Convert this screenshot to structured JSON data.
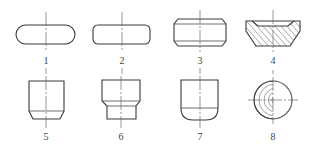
{
  "figure": {
    "labels": [
      "1",
      "2",
      "3",
      "4",
      "5",
      "6",
      "7",
      "8"
    ],
    "shapes": [
      {
        "id": "1",
        "kind": "stadium (full rounded ends)"
      },
      {
        "id": "2",
        "kind": "rounded rectangle"
      },
      {
        "id": "3",
        "kind": "rectangle with chamfered corners and inner lines"
      },
      {
        "id": "4",
        "kind": "hatched section with top/bottom chamfers"
      },
      {
        "id": "5",
        "kind": "cup with chamfered bottom"
      },
      {
        "id": "6",
        "kind": "stepped cylinder"
      },
      {
        "id": "7",
        "kind": "cup with rounded bottom"
      },
      {
        "id": "8",
        "kind": "circle with concentric arcs (spherical end view)"
      }
    ],
    "colors": {
      "line": "#3a3a3a",
      "background": "#ffffff"
    }
  }
}
